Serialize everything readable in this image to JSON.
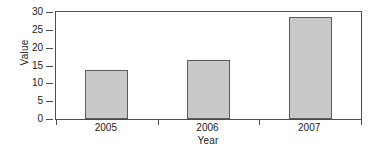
{
  "chart_data": {
    "type": "bar",
    "title": "",
    "categories": [
      "2005",
      "2006",
      "2007"
    ],
    "values": [
      13.7,
      16.5,
      28.5
    ],
    "xlabel": "Year",
    "ylabel": "Value",
    "ylim": [
      0,
      30
    ],
    "yticks": [
      0,
      5,
      10,
      15,
      20,
      25,
      30
    ],
    "ytick_labels": [
      "0",
      "5",
      "10",
      "15",
      "20",
      "25",
      "30"
    ],
    "xtick_labels": [
      "2005",
      "2006",
      "2007"
    ],
    "grid": false,
    "legend": null,
    "colors": {
      "bar_fill": "#c9c9c9",
      "bar_edge": "#5a5a5a",
      "axis": "#4d4d4d",
      "text": "#1a1a1a",
      "background": "#ffffff"
    }
  }
}
